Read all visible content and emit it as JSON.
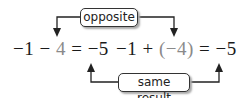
{
  "top_label": "opposite",
  "bottom_label": "same result",
  "equation_left": {
    "a": "−1",
    "op": "−",
    "b": "4",
    "eq": "=",
    "result": "−5"
  },
  "equation_right": {
    "a": "−1",
    "op": "+",
    "b": "(−4)",
    "eq": "=",
    "result": "−5"
  },
  "colors": {
    "text": "#1a1a1a",
    "highlight": "#8a8a8a",
    "lines": "#222222"
  }
}
